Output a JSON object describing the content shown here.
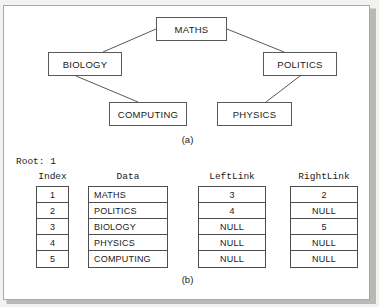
{
  "figure": {
    "caption_a": "(a)",
    "caption_b": "(b)",
    "root_label": "Root: 1"
  },
  "tree": {
    "nodes": [
      {
        "id": "maths",
        "label": "MATHS",
        "x": 152,
        "y": 11,
        "w": 71,
        "h": 24
      },
      {
        "id": "biology",
        "label": "BIOLOGY",
        "x": 44,
        "y": 46,
        "w": 74,
        "h": 24
      },
      {
        "id": "politics",
        "label": "POLITICS",
        "x": 259,
        "y": 46,
        "w": 74,
        "h": 24
      },
      {
        "id": "computing",
        "label": "COMPUTING",
        "x": 105,
        "y": 96,
        "w": 78,
        "h": 24
      },
      {
        "id": "physics",
        "label": "PHYSICS",
        "x": 213,
        "y": 96,
        "w": 75,
        "h": 24
      }
    ],
    "edges": [
      {
        "from": "maths",
        "to": "biology",
        "x1": 152,
        "y1": 23,
        "x2": 99,
        "y2": 46
      },
      {
        "from": "maths",
        "to": "politics",
        "x1": 223,
        "y1": 23,
        "x2": 280,
        "y2": 46
      },
      {
        "from": "biology",
        "to": "computing",
        "x1": 72,
        "y1": 70,
        "x2": 134,
        "y2": 96
      },
      {
        "from": "politics",
        "to": "physics",
        "x1": 296,
        "y1": 70,
        "x2": 262,
        "y2": 96
      }
    ]
  },
  "table": {
    "columns": [
      {
        "key": "index",
        "header": "Index",
        "align": "center",
        "x": 32,
        "y": 180,
        "w": 33,
        "head_x": 17,
        "head_w": 63,
        "values": [
          "1",
          "2",
          "3",
          "4",
          "5"
        ]
      },
      {
        "key": "data",
        "header": "Data",
        "align": "left",
        "x": 84,
        "y": 180,
        "w": 80,
        "head_x": 84,
        "head_w": 80,
        "values": [
          "MATHS",
          "POLITICS",
          "BIOLOGY",
          "PHYSICS",
          "COMPUTING"
        ]
      },
      {
        "key": "leftlink",
        "header": "LeftLink",
        "align": "center",
        "x": 194,
        "y": 180,
        "w": 68,
        "head_x": 194,
        "head_w": 68,
        "values": [
          "3",
          "4",
          "NULL",
          "NULL",
          "NULL"
        ]
      },
      {
        "key": "rightlink",
        "header": "RightLink",
        "align": "center",
        "x": 286,
        "y": 180,
        "w": 68,
        "head_x": 286,
        "head_w": 68,
        "values": [
          "2",
          "NULL",
          "5",
          "NULL",
          "NULL"
        ]
      }
    ],
    "row_count": 5,
    "row_height": 16
  },
  "colors": {
    "page_background": "#f2f2f0",
    "panel_background": "#ffffff",
    "panel_border": "#a8a8a6",
    "node_border": "#595959",
    "edge_stroke": "#595959",
    "table_border": "#4d4d4d",
    "text": "#1a1a1a",
    "shadow": "#b9b9b5"
  }
}
